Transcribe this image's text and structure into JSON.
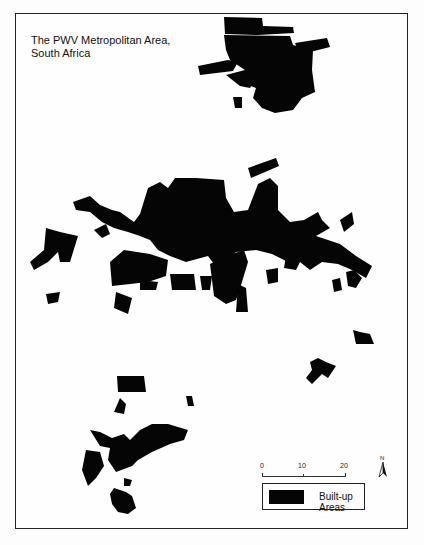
{
  "map": {
    "title_line1": "The PWV Metropolitan Area,",
    "title_line2": "South Africa",
    "fill_color": "#050505",
    "frame_color": "#222222"
  },
  "scale_bar": {
    "ticks": [
      "0",
      "10",
      "20"
    ]
  },
  "north_arrow": {
    "label": "N"
  },
  "legend": {
    "items": [
      {
        "label": "Built-up Areas",
        "color": "#050505"
      }
    ]
  }
}
